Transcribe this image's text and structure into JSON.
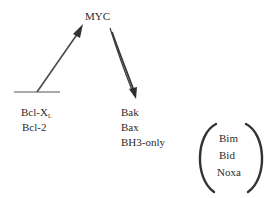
{
  "diagram": {
    "center_node": {
      "label": "MYC"
    },
    "inhibited_group": {
      "items": [
        {
          "label_main": "Bcl-X",
          "label_sub": "L"
        },
        {
          "label_main": "Bcl-2",
          "label_sub": ""
        }
      ]
    },
    "activated_group": {
      "items": [
        "Bak",
        "Bax",
        "BH3-only"
      ]
    },
    "bracketed_group": {
      "items": [
        "Bim",
        "Bid",
        "Noxa"
      ]
    },
    "edges": [
      {
        "from": "inhibited_group",
        "to": "MYC",
        "type": "arrow"
      },
      {
        "from": "MYC",
        "to": "activated_group",
        "type": "arrow"
      }
    ],
    "colors": {
      "stroke": "#3a3a3a",
      "text": "#2b2b2b",
      "background": "#ffffff"
    }
  }
}
